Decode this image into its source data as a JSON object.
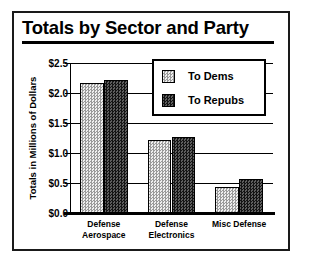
{
  "chart_data": {
    "type": "bar",
    "title": "Totals by Sector and Party",
    "xlabel": "",
    "ylabel": "Totals in Millions of Dollars",
    "categories": [
      "Defense Aerospace",
      "Defense Electronics",
      "Misc Defense"
    ],
    "category_lines": [
      [
        "Defense",
        "Aerospace"
      ],
      [
        "Defense",
        "Electronics"
      ],
      [
        "Misc Defense"
      ]
    ],
    "series": [
      {
        "name": "To Dems",
        "values": [
          2.17,
          1.21,
          0.44
        ],
        "color": "#cfcfcf"
      },
      {
        "name": "To Repubs",
        "values": [
          2.22,
          1.26,
          0.56
        ],
        "color": "#3a3a3a"
      }
    ],
    "ylim": [
      0.0,
      2.5
    ],
    "yticks": [
      0.0,
      0.5,
      1.0,
      1.5,
      2.0,
      2.5
    ],
    "ytick_labels": [
      "$0.0",
      "$0.5",
      "$1.0",
      "$1.5",
      "$2.0",
      "$2.5"
    ],
    "grid": true,
    "legend_position": "top-right"
  },
  "legend": {
    "entries": [
      {
        "label": "To Dems"
      },
      {
        "label": "To Repubs"
      }
    ]
  }
}
